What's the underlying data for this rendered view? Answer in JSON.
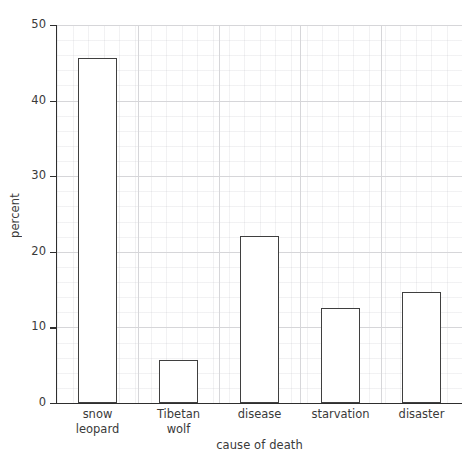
{
  "chart_data": {
    "type": "bar",
    "title": "",
    "subtitle": "",
    "xlabel": "cause of death",
    "ylabel": "percent",
    "categories": [
      "snow\nleopard",
      "Tibetan\nwolf",
      "disease",
      "starvation",
      "disaster"
    ],
    "category_labels_flat": [
      "snow leopard",
      "Tibetan wolf",
      "disease",
      "starvation",
      "disaster"
    ],
    "values": [
      45.6,
      5.7,
      22.1,
      12.6,
      14.7
    ],
    "ylim": [
      0,
      50
    ],
    "yticks": [
      0,
      10,
      20,
      30,
      40,
      50
    ],
    "ytick_labels": [
      "0",
      "10",
      "20",
      "30",
      "40",
      "50"
    ],
    "xlim": [
      0,
      5
    ],
    "grid": true,
    "grid_minor": true,
    "legend": null,
    "legend_position": "none",
    "bar_facecolor": "#ffffff",
    "bar_edgecolor": "#3f3f3f",
    "axis_color": "#2e2e2e",
    "grid_color": "#d6d6d9",
    "background_color": "#ffffff",
    "text_color": "#3a3a3a"
  },
  "figure": {
    "width": 475,
    "height": 458
  }
}
